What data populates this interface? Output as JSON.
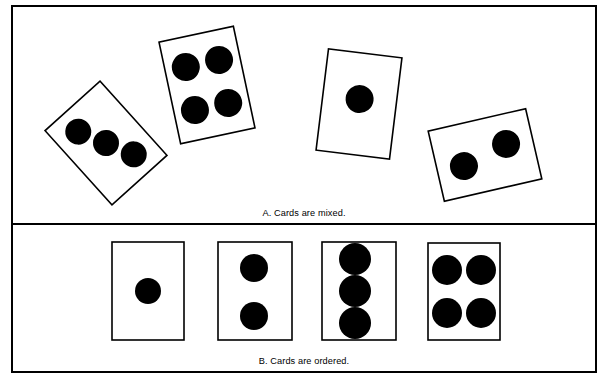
{
  "figure": {
    "background_color": "#ffffff",
    "ink_color": "#000000",
    "frame": {
      "x": 12,
      "y": 6,
      "width": 584,
      "height": 366,
      "stroke_width": 2
    },
    "divider": {
      "y": 224,
      "stroke_width": 2
    },
    "panels": [
      {
        "id": "panel-a",
        "caption": "A.  Cards are mixed.",
        "caption_x": 304,
        "caption_y": 216,
        "description": "mixed",
        "cards": [
          {
            "name": "card-three-pips-rotated",
            "pips": 3,
            "cx": 106,
            "cy": 143,
            "w": 74,
            "h": 100,
            "rotation": -42,
            "pip_layout": "diagonal-three",
            "pip_radius": 13,
            "pip_offsets": [
              [
                -13,
                -27
              ],
              [
                0,
                0
              ],
              [
                13,
                27
              ]
            ]
          },
          {
            "name": "card-four-pips-rotated",
            "pips": 4,
            "cx": 207,
            "cy": 85,
            "w": 76,
            "h": 104,
            "rotation": -12,
            "pip_layout": "quad",
            "pip_radius": 14,
            "pip_offsets": [
              [
                -17,
                -22
              ],
              [
                17,
                -22
              ],
              [
                -17,
                22
              ],
              [
                17,
                22
              ]
            ]
          },
          {
            "name": "card-one-pip-rotated",
            "pips": 1,
            "cx": 359,
            "cy": 104,
            "w": 74,
            "h": 102,
            "rotation": 7,
            "pip_layout": "center",
            "pip_radius": 14,
            "pip_offsets": [
              [
                0,
                -5
              ]
            ]
          },
          {
            "name": "card-two-pips-rotated",
            "pips": 2,
            "cx": 485,
            "cy": 155,
            "w": 100,
            "h": 72,
            "rotation": -13,
            "pip_layout": "horizontal-two",
            "pip_radius": 14,
            "pip_offsets": [
              [
                -23,
                6
              ],
              [
                23,
                -6
              ]
            ]
          }
        ]
      },
      {
        "id": "panel-b",
        "caption": "B.  Cards are ordered.",
        "caption_x": 304,
        "caption_y": 364,
        "description": "ordered",
        "cards": [
          {
            "name": "card-one-pip",
            "pips": 1,
            "x": 112,
            "y": 242,
            "w": 72,
            "h": 98,
            "rotation": 0,
            "pip_radius": 13,
            "pip_centers": [
              [
                148,
                291
              ]
            ]
          },
          {
            "name": "card-two-pips",
            "pips": 2,
            "x": 218,
            "y": 242,
            "w": 74,
            "h": 98,
            "rotation": 0,
            "pip_radius": 14,
            "pip_centers": [
              [
                254,
                268
              ],
              [
                254,
                316
              ]
            ]
          },
          {
            "name": "card-three-pips",
            "pips": 3,
            "x": 322,
            "y": 242,
            "w": 74,
            "h": 98,
            "rotation": 0,
            "pip_radius": 16,
            "pip_centers": [
              [
                355,
                259
              ],
              [
                355,
                291
              ],
              [
                355,
                323
              ]
            ]
          },
          {
            "name": "card-four-pips",
            "pips": 4,
            "x": 428,
            "y": 243,
            "w": 72,
            "h": 97,
            "rotation": 0,
            "pip_radius": 15,
            "pip_centers": [
              [
                447,
                270
              ],
              [
                481,
                270
              ],
              [
                447,
                313
              ],
              [
                481,
                313
              ]
            ]
          }
        ]
      }
    ]
  }
}
